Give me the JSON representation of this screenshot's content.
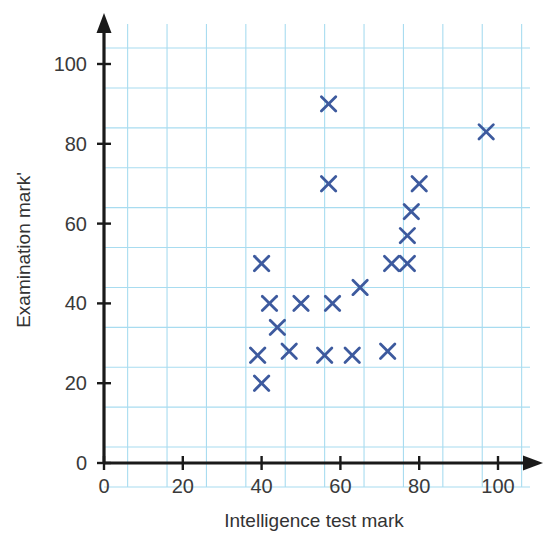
{
  "chart_data": {
    "type": "scatter",
    "title": "",
    "xlabel": "Intelligence test mark",
    "ylabel": "Examination mark'",
    "xlim": [
      0,
      100
    ],
    "ylim": [
      0,
      100
    ],
    "xticks": [
      0,
      20,
      40,
      60,
      80,
      100
    ],
    "yticks": [
      0,
      20,
      40,
      60,
      80,
      100
    ],
    "xtick_labels": [
      "0",
      "20",
      "40",
      "60",
      "80",
      "100"
    ],
    "ytick_labels": [
      "0",
      "20",
      "40",
      "60",
      "80",
      "100"
    ],
    "grid": true,
    "grid_step": 10,
    "grid_color": "#a8dcf0",
    "legend": false,
    "marker": "x",
    "marker_color": "#3d5a9e",
    "axis_color": "#1a1a1a",
    "points": [
      {
        "x": 39,
        "y": 27
      },
      {
        "x": 40,
        "y": 20
      },
      {
        "x": 40,
        "y": 50
      },
      {
        "x": 42,
        "y": 40
      },
      {
        "x": 44,
        "y": 34
      },
      {
        "x": 47,
        "y": 28
      },
      {
        "x": 50,
        "y": 40
      },
      {
        "x": 56,
        "y": 27
      },
      {
        "x": 57,
        "y": 70
      },
      {
        "x": 57,
        "y": 90
      },
      {
        "x": 58,
        "y": 40
      },
      {
        "x": 63,
        "y": 27
      },
      {
        "x": 65,
        "y": 44
      },
      {
        "x": 72,
        "y": 28
      },
      {
        "x": 73,
        "y": 50
      },
      {
        "x": 77,
        "y": 50
      },
      {
        "x": 77,
        "y": 57
      },
      {
        "x": 78,
        "y": 63
      },
      {
        "x": 80,
        "y": 70
      },
      {
        "x": 97,
        "y": 83
      }
    ]
  }
}
